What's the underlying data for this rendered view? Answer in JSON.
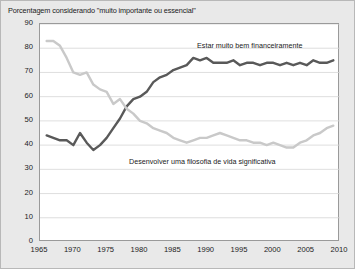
{
  "chart_data": {
    "type": "line",
    "title": "Porcentagem considerando \"muito importante ou essencial\"",
    "xlabel": "",
    "ylabel": "",
    "xlim": [
      1965,
      2010
    ],
    "ylim": [
      0,
      90
    ],
    "grid": true,
    "legend_position": "inline-annotation",
    "y_ticks": [
      0,
      10,
      20,
      30,
      40,
      50,
      60,
      70,
      80,
      90
    ],
    "x_ticks": [
      1965,
      1970,
      1975,
      1980,
      1985,
      1990,
      1995,
      2000,
      2005,
      2010
    ],
    "series": [
      {
        "name": "Estar muito bem financeiramente",
        "color": "#595959",
        "label_x": 1994,
        "label_y": 84,
        "x": [
          1966,
          1967,
          1968,
          1969,
          1970,
          1971,
          1972,
          1973,
          1974,
          1975,
          1976,
          1977,
          1978,
          1979,
          1980,
          1981,
          1982,
          1983,
          1984,
          1985,
          1986,
          1987,
          1988,
          1989,
          1990,
          1991,
          1992,
          1993,
          1994,
          1995,
          1996,
          1997,
          1998,
          1999,
          2000,
          2001,
          2002,
          2003,
          2004,
          2005,
          2006,
          2007,
          2008,
          2009
        ],
        "values": [
          44,
          43,
          42,
          42,
          40,
          45,
          41,
          38,
          40,
          43,
          47,
          51,
          56,
          59,
          60,
          62,
          66,
          68,
          69,
          71,
          72,
          73,
          76,
          75,
          76,
          74,
          74,
          74,
          75,
          73,
          74,
          74,
          73,
          74,
          74,
          73,
          74,
          73,
          74,
          73,
          75,
          74,
          74,
          75
        ]
      },
      {
        "name": "Desenvolver uma filosofia de vida significativa",
        "color": "#c9c9c9",
        "label_x": 1984,
        "label_y": 31,
        "x": [
          1966,
          1967,
          1968,
          1969,
          1970,
          1971,
          1972,
          1973,
          1974,
          1975,
          1976,
          1977,
          1978,
          1979,
          1980,
          1981,
          1982,
          1983,
          1984,
          1985,
          1986,
          1987,
          1988,
          1989,
          1990,
          1991,
          1992,
          1993,
          1994,
          1995,
          1996,
          1997,
          1998,
          1999,
          2000,
          2001,
          2002,
          2003,
          2004,
          2005,
          2006,
          2007,
          2008,
          2009
        ],
        "values": [
          83,
          83,
          81,
          76,
          70,
          69,
          70,
          65,
          63,
          62,
          57,
          59,
          55,
          53,
          50,
          49,
          47,
          46,
          45,
          43,
          42,
          41,
          42,
          43,
          43,
          44,
          45,
          44,
          43,
          42,
          42,
          41,
          41,
          40,
          41,
          40,
          39,
          39,
          41,
          42,
          44,
          45,
          47,
          48
        ]
      }
    ]
  }
}
